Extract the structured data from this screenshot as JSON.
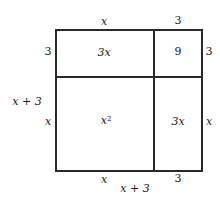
{
  "diagram": {
    "top_labels": {
      "left": "x",
      "right": "3"
    },
    "left_labels": {
      "top": "3",
      "bottom": "x",
      "total": "x + 3"
    },
    "right_labels": {
      "top": "3",
      "bottom": "x"
    },
    "bottom_labels": {
      "left": "x",
      "right": "3",
      "total": "x + 3"
    },
    "cells": {
      "top_left": "3x",
      "top_right": "9",
      "bottom_left_base": "x",
      "bottom_left_exp": "2",
      "bottom_right": "3x"
    }
  }
}
